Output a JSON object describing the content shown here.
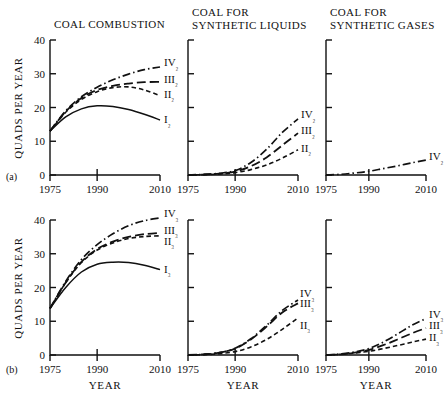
{
  "figure": {
    "width": 444,
    "height": 397,
    "background": "#ffffff",
    "ink_color": "#111111"
  },
  "row_marks": [
    {
      "name": "row-a",
      "label": "(a)"
    },
    {
      "name": "row-b",
      "label": "(b)"
    }
  ],
  "axis_titles": {
    "y": "QUADS PER YEAR",
    "x": "YEAR"
  },
  "panel_titles": {
    "combustion": "COAL COMBUSTION",
    "liquids_line1": "COAL FOR",
    "liquids_line2": "SYNTHETIC LIQUIDS",
    "gases_line1": "COAL FOR",
    "gases_line2": "SYNTHETIC GASES"
  },
  "axes": {
    "y_ticks": [
      0,
      10,
      20,
      30,
      40
    ],
    "y_tick_labels": [
      "0",
      "10",
      "20",
      "30",
      "40"
    ],
    "y_range": [
      0,
      40
    ],
    "x_ticks": [
      1975,
      1990,
      2010
    ],
    "x_tick_labels": [
      "1975",
      "1990",
      "2010"
    ],
    "x_range": [
      1975,
      2010
    ],
    "grid": false,
    "y_labels_shown_on": "left-panel-only"
  },
  "line_styles": {
    "I": "solid",
    "II": "short-dash",
    "III": "long-dash",
    "IV": "dash-dot"
  },
  "chart_data": [
    {
      "id": "panel-a-combustion",
      "type": "line",
      "title": "COAL COMBUSTION",
      "row": "(a)",
      "xlabel": "YEAR",
      "ylabel": "QUADS PER YEAR",
      "xlim": [
        1975,
        2010
      ],
      "ylim": [
        0,
        40
      ],
      "x": [
        1975,
        1980,
        1985,
        1990,
        1995,
        2000,
        2005,
        2010
      ],
      "series": [
        {
          "name": "I2",
          "label": "I₂",
          "style": "solid",
          "values": [
            13.0,
            17.2,
            19.6,
            20.5,
            20.3,
            19.4,
            18.0,
            16.3
          ]
        },
        {
          "name": "II2",
          "label": "II₂",
          "style": "short-dash",
          "values": [
            13.0,
            18.6,
            22.4,
            24.7,
            25.9,
            26.1,
            25.2,
            23.5
          ]
        },
        {
          "name": "III2",
          "label": "III₂",
          "style": "long-dash",
          "values": [
            13.0,
            18.8,
            22.8,
            25.2,
            26.4,
            27.1,
            27.5,
            27.6
          ]
        },
        {
          "name": "IV2",
          "label": "IV₂",
          "style": "dash-dot",
          "values": [
            13.0,
            19.0,
            23.2,
            26.0,
            28.2,
            29.9,
            31.2,
            32.0
          ]
        }
      ]
    },
    {
      "id": "panel-a-liquids",
      "type": "line",
      "title": "COAL FOR SYNTHETIC LIQUIDS",
      "row": "(a)",
      "xlabel": "YEAR",
      "xlim": [
        1975,
        2010
      ],
      "ylim": [
        0,
        40
      ],
      "x": [
        1975,
        1980,
        1985,
        1990,
        1995,
        2000,
        2005,
        2010
      ],
      "series": [
        {
          "name": "II2",
          "label": "II₂",
          "style": "short-dash",
          "values": [
            0.0,
            0.1,
            0.3,
            0.7,
            1.6,
            3.0,
            5.0,
            7.5
          ]
        },
        {
          "name": "III2",
          "label": "III₂",
          "style": "long-dash",
          "values": [
            0.0,
            0.1,
            0.4,
            1.0,
            2.6,
            5.2,
            8.8,
            12.4
          ]
        },
        {
          "name": "IV2",
          "label": "IV₂",
          "style": "dash-dot",
          "values": [
            0.0,
            0.2,
            0.5,
            1.3,
            3.7,
            7.6,
            12.6,
            16.6
          ]
        }
      ]
    },
    {
      "id": "panel-a-gases",
      "type": "line",
      "title": "COAL FOR SYNTHETIC GASES",
      "row": "(a)",
      "xlabel": "YEAR",
      "xlim": [
        1975,
        2010
      ],
      "ylim": [
        0,
        40
      ],
      "x": [
        1975,
        1980,
        1985,
        1990,
        1995,
        2000,
        2005,
        2010
      ],
      "series": [
        {
          "name": "IV2",
          "label": "IV₂",
          "style": "dash-dot",
          "values": [
            0.0,
            0.2,
            0.6,
            1.1,
            1.9,
            2.7,
            3.6,
            4.4
          ]
        }
      ]
    },
    {
      "id": "panel-b-combustion",
      "type": "line",
      "title": "COAL COMBUSTION",
      "row": "(b)",
      "xlabel": "YEAR",
      "ylabel": "QUADS PER YEAR",
      "xlim": [
        1975,
        2010
      ],
      "ylim": [
        0,
        40
      ],
      "x": [
        1975,
        1980,
        1985,
        1990,
        1995,
        2000,
        2005,
        2010
      ],
      "series": [
        {
          "name": "I3",
          "label": "I₃",
          "style": "solid",
          "values": [
            13.8,
            20.0,
            24.6,
            26.9,
            27.5,
            27.4,
            26.6,
            25.3
          ]
        },
        {
          "name": "II3",
          "label": "II₃",
          "style": "short-dash",
          "values": [
            13.8,
            21.4,
            27.4,
            31.1,
            33.2,
            34.5,
            35.1,
            35.3
          ]
        },
        {
          "name": "III3",
          "label": "III₃",
          "style": "long-dash",
          "values": [
            13.8,
            21.5,
            27.6,
            31.4,
            33.6,
            35.0,
            35.8,
            36.2
          ]
        },
        {
          "name": "IV3",
          "label": "IV₃",
          "style": "dash-dot",
          "values": [
            13.8,
            21.8,
            28.3,
            32.7,
            35.9,
            38.3,
            39.8,
            40.6
          ]
        }
      ]
    },
    {
      "id": "panel-b-liquids",
      "type": "line",
      "title": "COAL FOR SYNTHETIC LIQUIDS",
      "row": "(b)",
      "xlabel": "YEAR",
      "xlim": [
        1975,
        2010
      ],
      "ylim": [
        0,
        40
      ],
      "x": [
        1975,
        1980,
        1985,
        1990,
        1995,
        2000,
        2005,
        2010
      ],
      "series": [
        {
          "name": "II3",
          "label": "II₃",
          "style": "short-dash",
          "values": [
            0.0,
            0.1,
            0.4,
            1.0,
            2.4,
            4.6,
            7.6,
            11.0
          ]
        },
        {
          "name": "III3",
          "label": "III₃",
          "style": "long-dash",
          "values": [
            0.0,
            0.2,
            0.7,
            1.9,
            4.6,
            8.4,
            12.6,
            15.3
          ]
        },
        {
          "name": "IV3",
          "label": "IV₃",
          "style": "dash-dot",
          "values": [
            0.0,
            0.2,
            0.7,
            2.0,
            4.8,
            8.8,
            13.2,
            16.3
          ]
        }
      ]
    },
    {
      "id": "panel-b-gases",
      "type": "line",
      "title": "COAL FOR SYNTHETIC GASES",
      "row": "(b)",
      "xlabel": "YEAR",
      "xlim": [
        1975,
        2010
      ],
      "ylim": [
        0,
        40
      ],
      "x": [
        1975,
        1980,
        1985,
        1990,
        1995,
        2000,
        2005,
        2010
      ],
      "series": [
        {
          "name": "II3",
          "label": "II₃",
          "style": "short-dash",
          "values": [
            0.0,
            0.2,
            0.6,
            1.1,
            1.9,
            2.8,
            3.8,
            4.7
          ]
        },
        {
          "name": "III3",
          "label": "III₃",
          "style": "long-dash",
          "values": [
            0.0,
            0.2,
            0.7,
            1.5,
            2.9,
            4.6,
            6.4,
            8.0
          ]
        },
        {
          "name": "IV3",
          "label": "IV₃",
          "style": "dash-dot",
          "values": [
            0.0,
            0.3,
            0.9,
            1.9,
            3.8,
            6.2,
            8.8,
            10.8
          ]
        }
      ]
    }
  ],
  "layout": {
    "panels": [
      {
        "id": "panel-a-combustion",
        "ox": 50,
        "oy": 175,
        "w": 110,
        "h": 135,
        "show_y_labels": true,
        "title_key": "combustion",
        "title_lines": 1
      },
      {
        "id": "panel-a-liquids",
        "ox": 188,
        "oy": 175,
        "w": 110,
        "h": 135,
        "show_y_labels": false,
        "title_key": "liquids",
        "title_lines": 2
      },
      {
        "id": "panel-a-gases",
        "ox": 326,
        "oy": 175,
        "w": 100,
        "h": 135,
        "show_y_labels": false,
        "title_key": "gases",
        "title_lines": 2
      },
      {
        "id": "panel-b-combustion",
        "ox": 50,
        "oy": 355,
        "w": 110,
        "h": 135,
        "show_y_labels": true,
        "title_key": "",
        "title_lines": 0
      },
      {
        "id": "panel-b-liquids",
        "ox": 188,
        "oy": 355,
        "w": 110,
        "h": 135,
        "show_y_labels": false,
        "title_key": "",
        "title_lines": 0
      },
      {
        "id": "panel-b-gases",
        "ox": 326,
        "oy": 355,
        "w": 100,
        "h": 135,
        "show_y_labels": false,
        "title_key": "",
        "title_lines": 0
      }
    ]
  }
}
